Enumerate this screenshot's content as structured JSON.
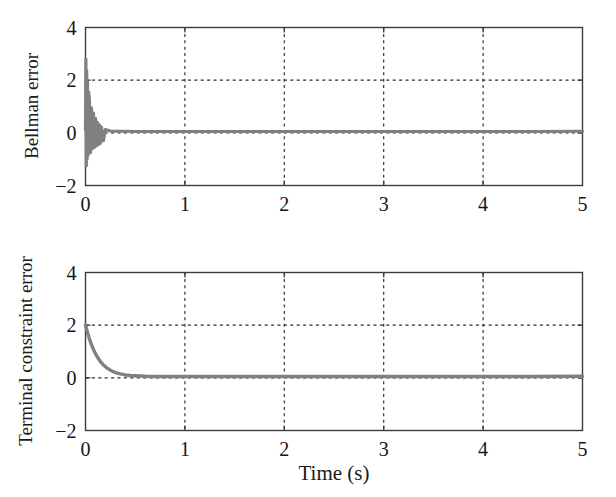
{
  "figure": {
    "name": "bellman-and-terminal-constraint-error-plots",
    "background_color": "#ffffff",
    "trace_color": "#808080",
    "axis_color": "#3c3c3c",
    "grid_color": "#2b2b2b"
  },
  "chart_data": [
    {
      "type": "line",
      "name": "bellman-error-plot",
      "title": "",
      "xlabel": "",
      "ylabel": "Bellman error",
      "xlim": [
        0,
        5
      ],
      "ylim": [
        -2,
        4
      ],
      "xticks": [
        0,
        1,
        2,
        3,
        4,
        5
      ],
      "xtick_labels": [
        "0",
        "1",
        "2",
        "3",
        "4",
        "5"
      ],
      "yticks": [
        -2,
        0,
        2,
        4
      ],
      "ytick_labels": [
        "−2",
        "0",
        "2",
        "4"
      ],
      "grid": true,
      "grid_style": "dotted",
      "grid_x": [
        1,
        2,
        3,
        4
      ],
      "grid_y": [
        0,
        2
      ],
      "legend": null,
      "series": [
        {
          "name": "Bellman error",
          "color": "#808080",
          "linewidth": 3.2,
          "description": "Large oscillatory transient at t=0 spanning about +2.8 down to -1.3, collapsing to a thin band near 0 after t = 0.2 s, with small residual ripple held at about 0.05 for the rest of the run.",
          "x": [
            0,
            0.004,
            0.008,
            0.012,
            0.016,
            0.02,
            0.026,
            0.032,
            0.04,
            0.05,
            0.06,
            0.07,
            0.08,
            0.09,
            0.1,
            0.11,
            0.12,
            0.13,
            0.14,
            0.15,
            0.16,
            0.18,
            0.2,
            0.25,
            0.3,
            0.4,
            0.5,
            0.75,
            1,
            1.5,
            2,
            2.5,
            3,
            3.5,
            4,
            4.5,
            5
          ],
          "y": [
            0.1,
            2.8,
            -1.25,
            2.35,
            -1.0,
            1.95,
            -0.85,
            1.55,
            1.2,
            -0.75,
            0.95,
            -0.6,
            0.75,
            -0.55,
            0.55,
            -0.5,
            0.4,
            -0.45,
            0.3,
            -0.4,
            0.22,
            -0.3,
            0.12,
            0.07,
            0.06,
            0.06,
            0.05,
            0.05,
            0.05,
            0.05,
            0.05,
            0.05,
            0.05,
            0.05,
            0.05,
            0.05,
            0.06
          ]
        }
      ]
    },
    {
      "type": "line",
      "name": "terminal-constraint-error-plot",
      "title": "",
      "xlabel": "Time (s)",
      "ylabel": "Terminal constraint error",
      "xlim": [
        0,
        5
      ],
      "ylim": [
        -2,
        4
      ],
      "xticks": [
        0,
        1,
        2,
        3,
        4,
        5
      ],
      "xtick_labels": [
        "0",
        "1",
        "2",
        "3",
        "4",
        "5"
      ],
      "yticks": [
        -2,
        0,
        2,
        4
      ],
      "ytick_labels": [
        "−2",
        "0",
        "2",
        "4"
      ],
      "grid": true,
      "grid_style": "dotted",
      "grid_x": [
        1,
        2,
        3,
        4
      ],
      "grid_y": [
        0,
        2
      ],
      "legend": null,
      "series": [
        {
          "name": "Terminal constraint error",
          "color": "#808080",
          "linewidth": 3.4,
          "description": "Monotone exponential decay starting at 2.0 at t = 0, crossing 0.5 near t = 0.15 s and flattening onto a near-zero steady value of about 0.05 from t ≈ 0.5 s onward.",
          "x": [
            0,
            0.02,
            0.04,
            0.06,
            0.08,
            0.1,
            0.12,
            0.15,
            0.18,
            0.21,
            0.25,
            0.3,
            0.35,
            0.4,
            0.45,
            0.5,
            0.6,
            0.7,
            0.8,
            1,
            1.25,
            1.5,
            2,
            2.5,
            3,
            3.5,
            4,
            4.5,
            5
          ],
          "y": [
            2.0,
            1.72,
            1.47,
            1.26,
            1.08,
            0.92,
            0.79,
            0.62,
            0.49,
            0.39,
            0.29,
            0.2,
            0.15,
            0.11,
            0.09,
            0.08,
            0.06,
            0.05,
            0.05,
            0.05,
            0.05,
            0.05,
            0.05,
            0.05,
            0.05,
            0.05,
            0.05,
            0.05,
            0.06
          ]
        }
      ]
    }
  ]
}
